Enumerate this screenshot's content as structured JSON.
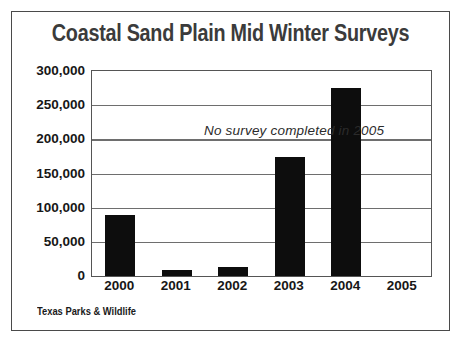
{
  "chart_data": {
    "type": "bar",
    "title": "Coastal Sand Plain Mid Winter Surveys",
    "categories": [
      "2000",
      "2001",
      "2002",
      "2003",
      "2004",
      "2005"
    ],
    "values": [
      90000,
      9000,
      13000,
      174000,
      275000,
      0
    ],
    "xlabel": "",
    "ylabel": "",
    "ylim": [
      0,
      300000
    ],
    "ytick_values": [
      0,
      50000,
      100000,
      150000,
      200000,
      250000,
      300000
    ],
    "ytick_labels": [
      "0",
      "50,000",
      "100,000",
      "150,000",
      "200,000",
      "250,000",
      "300,000"
    ],
    "grid": true,
    "legend": false,
    "bar_color": "#0d0d0d",
    "annotations": [
      {
        "text": "No survey completed in 2005",
        "value_y": 200000
      }
    ]
  },
  "footer": {
    "credit": "Texas Parks & Wildlife"
  },
  "style": {
    "frame_color": "#4a4a4a",
    "grid_color": "#6e6e6e",
    "title_color": "#3b3b3b",
    "text_color": "#171717",
    "background": "#ffffff"
  }
}
